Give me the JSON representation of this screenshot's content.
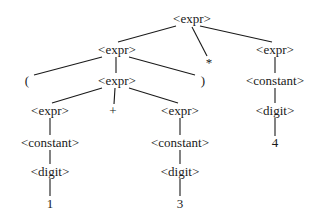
{
  "diagram": {
    "type": "parse-tree",
    "nodes": [
      {
        "id": "n0",
        "label": "<expr>",
        "x": 192,
        "y": 18
      },
      {
        "id": "n1",
        "label": "<expr>",
        "x": 117,
        "y": 49
      },
      {
        "id": "n2",
        "label": "*",
        "x": 209,
        "y": 62
      },
      {
        "id": "n3",
        "label": "<expr>",
        "x": 275,
        "y": 49
      },
      {
        "id": "n4",
        "label": "(",
        "x": 27,
        "y": 80
      },
      {
        "id": "n5",
        "label": "<expr>",
        "x": 117,
        "y": 80
      },
      {
        "id": "n6",
        "label": ")",
        "x": 203,
        "y": 80
      },
      {
        "id": "n7",
        "label": "<constant>",
        "x": 275,
        "y": 80
      },
      {
        "id": "n8",
        "label": "<expr>",
        "x": 50,
        "y": 110
      },
      {
        "id": "n9",
        "label": "+",
        "x": 113,
        "y": 110
      },
      {
        "id": "n10",
        "label": "<expr>",
        "x": 180,
        "y": 110
      },
      {
        "id": "n11",
        "label": "<digit>",
        "x": 275,
        "y": 110
      },
      {
        "id": "n12",
        "label": "<constant>",
        "x": 50,
        "y": 142
      },
      {
        "id": "n13",
        "label": "<constant>",
        "x": 180,
        "y": 142
      },
      {
        "id": "n14",
        "label": "4",
        "x": 275,
        "y": 142
      },
      {
        "id": "n15",
        "label": "<digit>",
        "x": 50,
        "y": 171
      },
      {
        "id": "n16",
        "label": "<digit>",
        "x": 180,
        "y": 171
      },
      {
        "id": "n17",
        "label": "1",
        "x": 50,
        "y": 203
      },
      {
        "id": "n18",
        "label": "3",
        "x": 180,
        "y": 203
      }
    ],
    "edges": [
      {
        "from": "n0",
        "to": "n1",
        "x1": 176,
        "y1": 26,
        "x2": 118,
        "y2": 42
      },
      {
        "from": "n0",
        "to": "n2",
        "x1": 192,
        "y1": 27,
        "x2": 207,
        "y2": 56
      },
      {
        "from": "n0",
        "to": "n3",
        "x1": 200,
        "y1": 26,
        "x2": 272,
        "y2": 42
      },
      {
        "from": "n1",
        "to": "n4",
        "x1": 102,
        "y1": 57,
        "x2": 34,
        "y2": 75
      },
      {
        "from": "n1",
        "to": "n5",
        "x1": 116,
        "y1": 57,
        "x2": 116,
        "y2": 73
      },
      {
        "from": "n1",
        "to": "n6",
        "x1": 129,
        "y1": 57,
        "x2": 195,
        "y2": 75
      },
      {
        "from": "n3",
        "to": "n7",
        "x1": 275,
        "y1": 57,
        "x2": 275,
        "y2": 73
      },
      {
        "from": "n5",
        "to": "n8",
        "x1": 102,
        "y1": 88,
        "x2": 52,
        "y2": 103
      },
      {
        "from": "n5",
        "to": "n9",
        "x1": 115,
        "y1": 88,
        "x2": 114,
        "y2": 104
      },
      {
        "from": "n5",
        "to": "n10",
        "x1": 129,
        "y1": 88,
        "x2": 178,
        "y2": 103
      },
      {
        "from": "n7",
        "to": "n11",
        "x1": 275,
        "y1": 88,
        "x2": 275,
        "y2": 103
      },
      {
        "from": "n8",
        "to": "n12",
        "x1": 50,
        "y1": 118,
        "x2": 50,
        "y2": 135
      },
      {
        "from": "n10",
        "to": "n13",
        "x1": 180,
        "y1": 118,
        "x2": 180,
        "y2": 135
      },
      {
        "from": "n11",
        "to": "n14",
        "x1": 275,
        "y1": 118,
        "x2": 275,
        "y2": 136
      },
      {
        "from": "n12",
        "to": "n15",
        "x1": 50,
        "y1": 150,
        "x2": 50,
        "y2": 164
      },
      {
        "from": "n13",
        "to": "n16",
        "x1": 180,
        "y1": 150,
        "x2": 180,
        "y2": 164
      },
      {
        "from": "n15",
        "to": "n17",
        "x1": 50,
        "y1": 179,
        "x2": 50,
        "y2": 196
      },
      {
        "from": "n16",
        "to": "n18",
        "x1": 180,
        "y1": 179,
        "x2": 180,
        "y2": 196
      }
    ]
  }
}
